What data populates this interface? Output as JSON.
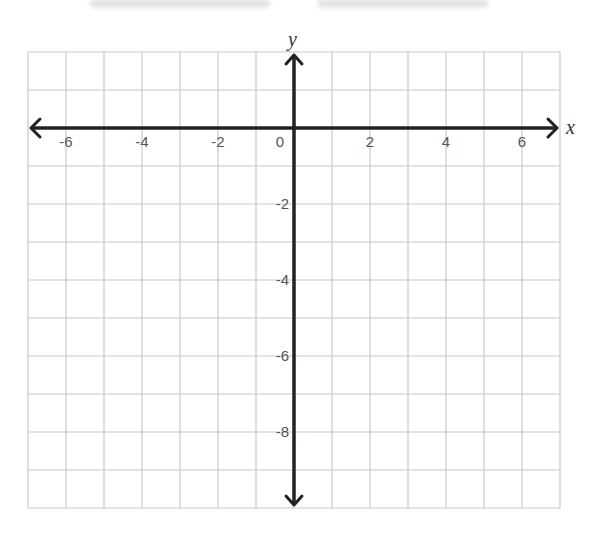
{
  "chart_data": {
    "type": "coordinate-grid",
    "title": "",
    "xlabel": "x",
    "ylabel": "y",
    "xlim": [
      -7,
      7
    ],
    "ylim": [
      -10,
      2
    ],
    "grid": true,
    "grid_step": 1,
    "x_ticks": [
      -6,
      -4,
      -2,
      0,
      2,
      4,
      6
    ],
    "x_tick_labels": [
      "-6",
      "-4",
      "-2",
      "0",
      "2",
      "4",
      "6"
    ],
    "y_ticks": [
      -2,
      -4,
      -6,
      -8
    ],
    "y_tick_labels": [
      "-2",
      "-4",
      "-6",
      "-8"
    ],
    "series": [],
    "legend": null
  },
  "style": {
    "grid_color": "#c8c8c8",
    "axis_color": "#222222",
    "label_color": "#555555",
    "smudge_color": "#dcdcdc"
  },
  "layout": {
    "origin_px": [
      294,
      128
    ],
    "cell_px": 38,
    "grid_left": 28,
    "grid_top": 52,
    "cols": 14,
    "rows": 12
  }
}
